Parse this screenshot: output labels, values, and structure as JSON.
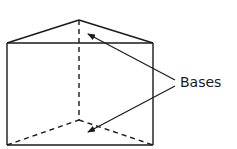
{
  "diagram": {
    "label": "Bases",
    "stroke_color": "#1a1a1a",
    "background": "#ffffff",
    "shape": "triangular-prism",
    "annotations": [
      {
        "text": "Bases",
        "points_to": [
          "top triangular base",
          "bottom triangular base"
        ]
      }
    ]
  }
}
